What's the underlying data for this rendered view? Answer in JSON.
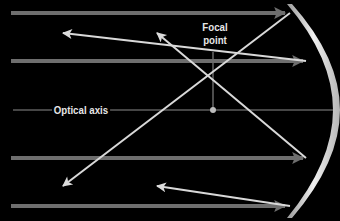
{
  "diagram": {
    "labels": {
      "optical_axis": "Optical axis",
      "focal_line1": "Focal",
      "focal_line2": "point"
    },
    "colors": {
      "background": "#000000",
      "incoming_ray": "#6e6e6e",
      "reflected_ray": "#d9d9d9",
      "axis_line": "#8c8c8c",
      "mirror_light": "#e8e8e8",
      "mirror_dark": "#9a9a9a",
      "label_text": "#e6e6e6"
    },
    "focal_point": {
      "x": 213,
      "y": 110
    },
    "optical_axis": {
      "y": 110,
      "x_start": 13,
      "x_end": 340
    },
    "incoming_rays": [
      {
        "y": 13,
        "x_start": 11,
        "x_end": 290
      },
      {
        "y": 61,
        "x_start": 11,
        "x_end": 305
      },
      {
        "y": 158,
        "x_start": 11,
        "x_end": 305
      },
      {
        "y": 206,
        "x_start": 11,
        "x_end": 290
      }
    ],
    "reflected_rays": [
      {
        "from": [
          290,
          13
        ],
        "to": [
          63,
          186
        ]
      },
      {
        "from": [
          305,
          61
        ],
        "to": [
          63,
          33
        ]
      },
      {
        "from": [
          305,
          158
        ],
        "to": [
          157,
          33
        ]
      },
      {
        "from": [
          290,
          206
        ],
        "to": [
          157,
          186
        ]
      }
    ]
  }
}
